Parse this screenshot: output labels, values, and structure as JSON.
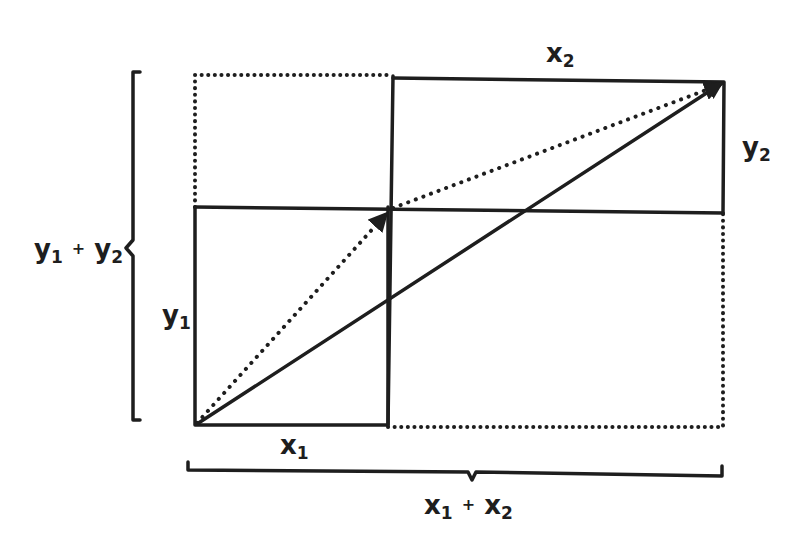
{
  "diagram": {
    "colors": {
      "ink": "#1e1e1e",
      "background": "#ffffff"
    },
    "labels": {
      "x1": {
        "base": "x",
        "sub": "1"
      },
      "x2": {
        "base": "x",
        "sub": "2"
      },
      "y1": {
        "base": "y",
        "sub": "1"
      },
      "y2": {
        "base": "y",
        "sub": "2"
      },
      "x_sum": {
        "a_base": "x",
        "a_sub": "1",
        "op": "+",
        "b_base": "x",
        "b_sub": "2"
      },
      "y_sum": {
        "a_base": "y",
        "a_sub": "1",
        "op": "+",
        "b_base": "y",
        "b_sub": "2"
      }
    },
    "shapes": {
      "solid_rect_v1": {
        "x": 195,
        "y": 207,
        "w": 193,
        "h": 218,
        "style": "solid"
      },
      "solid_rect_v2": {
        "x": 393,
        "y": 79,
        "w": 332,
        "h": 133,
        "style": "solid"
      },
      "dotted_rect_top_left": {
        "x": 195,
        "y": 75,
        "w": 198,
        "h": 132,
        "style": "dotted"
      },
      "dotted_rect_bottom_right": {
        "x": 388,
        "y": 212,
        "w": 337,
        "h": 215,
        "style": "dotted"
      },
      "vector_v1": {
        "from": [
          195,
          425
        ],
        "to": [
          390,
          210
        ],
        "style": "dotted-arrow"
      },
      "vector_v2": {
        "from": [
          390,
          210
        ],
        "to": [
          725,
          82
        ],
        "style": "dotted-arrow"
      },
      "vector_sum": {
        "from": [
          195,
          425
        ],
        "to": [
          725,
          82
        ],
        "style": "solid-arrow"
      },
      "brace_y": {
        "x": 132,
        "y_top": 72,
        "y_bottom": 420,
        "orientation": "left"
      },
      "brace_x": {
        "y": 468,
        "x_left": 188,
        "x_right": 722,
        "orientation": "bottom"
      }
    }
  }
}
